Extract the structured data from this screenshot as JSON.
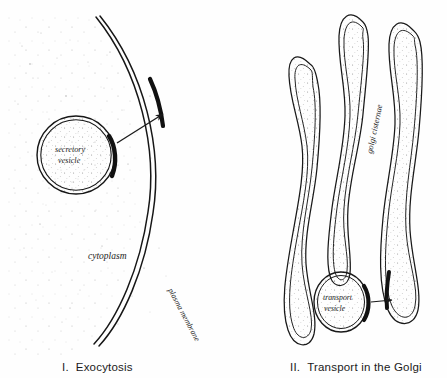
{
  "figure": {
    "background_color": "#fefefe",
    "ink_color": "#1a1a1a",
    "stipple_color": "#9a9a9a"
  },
  "panels": [
    {
      "id": "exocytosis",
      "number": "I.",
      "caption": "Exocytosis",
      "labels": {
        "vesicle_line1": "secretory",
        "vesicle_line2": "vesicle",
        "cytoplasm": "cytoplasm",
        "membrane": "plasma membrane"
      },
      "arrow": {
        "name": "fusion-arrow",
        "direction": "up-right",
        "from": [
          118,
          142
        ],
        "to": [
          165,
          112
        ]
      },
      "fusion_patch": {
        "name": "membrane-fusion-patch",
        "description": "thickened dark segment of plasma membrane"
      }
    },
    {
      "id": "golgi",
      "number": "II.",
      "caption": "Transport in the Golgi",
      "labels": {
        "cisternae": "golgi cisternae",
        "vesicle_line1": "transport",
        "vesicle_line2": "vesicle"
      },
      "arrow": {
        "name": "transport-arrow",
        "direction": "right",
        "from": [
          369,
          302
        ],
        "to": [
          397,
          300
        ]
      },
      "cisternae_count": 3
    }
  ]
}
